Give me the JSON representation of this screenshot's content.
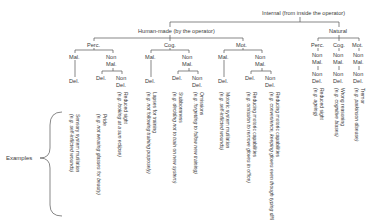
{
  "root": "Internal (from inside the operator)",
  "branches": {
    "human_made": "Human-made (by the operator)",
    "natural": "Natural"
  },
  "categories": {
    "perc": "Perc.",
    "cog": "Cog.",
    "mot": "Mot."
  },
  "labels": {
    "mal": "Mal.",
    "non": "Non",
    "mal2": "Mal.",
    "del": "Del.",
    "non_del": "Non",
    "del2": "Del."
  },
  "examples_label": "Examples",
  "examples": [
    {
      "title": "Sensory system mutilation",
      "example": "(e.g. self-inflicted wounds)"
    },
    {
      "title": "Pride",
      "example": "(e.g. not wearing glasses for beauty)"
    },
    {
      "title": "Reduced sight",
      "example": "(e.g. looking at a sun eclipse)"
    },
    {
      "title": "Lapses for training",
      "example": "(e.g. not following training purposely)"
    },
    {
      "title": "Stubbornness",
      "example": "(e.g. deciding not to train on new system)"
    },
    {
      "title": "Omissions",
      "example": "(e.g. forgetting to follow new training)"
    },
    {
      "title": "Motoric system mutilation",
      "example": "(e.g. self-inflicted wounds)"
    },
    {
      "title": "Reducing motoric capabilities",
      "example": "(e.g. omission to remove gloves in office)"
    },
    {
      "title": "Reducing motoric capabilities",
      "example": "(e.g. convenience, keeping gloves even though typing difficult)"
    },
    {
      "title": "Reduced sight",
      "example": "(e.g. ageing)"
    },
    {
      "title": "Wrong reasoning",
      "example": "(e.g. cognitive biases)"
    },
    {
      "title": "Tremor",
      "example": "(e.g. parkinson disease)"
    }
  ]
}
